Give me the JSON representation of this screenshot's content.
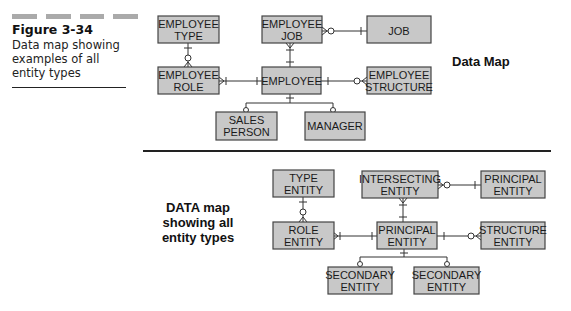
{
  "figure": {
    "number": "Figure 3-34",
    "caption": "Data map showing examples of all entity types"
  },
  "top_diagram": {
    "label": "Data Map",
    "entities": {
      "employee_type": [
        "EMPLOYEE",
        "TYPE"
      ],
      "employee_job": [
        "EMPLOYEE",
        "JOB"
      ],
      "job": [
        "JOB"
      ],
      "employee_role": [
        "EMPLOYEE",
        "ROLE"
      ],
      "employee": [
        "EMPLOYEE"
      ],
      "employee_structure": [
        "EMPLOYEE",
        "STRUCTURE"
      ],
      "sales_person": [
        "SALES",
        "PERSON"
      ],
      "manager": [
        "MANAGER"
      ]
    }
  },
  "bottom_diagram": {
    "label_lines": [
      "DATA map",
      "showing all",
      "entity types"
    ],
    "entities": {
      "type_entity": [
        "TYPE",
        "ENTITY"
      ],
      "intersecting_entity": [
        "INTERSECTING",
        "ENTITY"
      ],
      "principal_entity_right": [
        "PRINCIPAL",
        "ENTITY"
      ],
      "role_entity": [
        "ROLE",
        "ENTITY"
      ],
      "principal_entity": [
        "PRINCIPAL",
        "ENTITY"
      ],
      "structure_entity": [
        "STRUCTURE",
        "ENTITY"
      ],
      "secondary_entity_1": [
        "SECONDARY",
        "ENTITY"
      ],
      "secondary_entity_2": [
        "SECONDARY",
        "ENTITY"
      ]
    }
  }
}
